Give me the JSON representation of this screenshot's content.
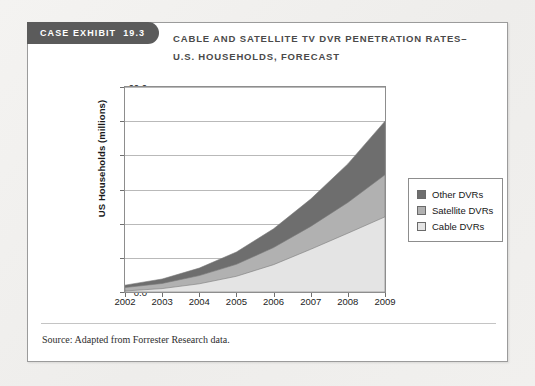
{
  "exhibit": {
    "label": "CASE EXHIBIT",
    "number": "19.3"
  },
  "title": {
    "line1": "CABLE AND SATELLITE TV DVR PENETRATION RATES–",
    "line2": "U.S. HOUSEHOLDS, FORECAST"
  },
  "source": "Source: Adapted from Forrester Research data.",
  "colors": {
    "other_dvrs": "#6e6e6e",
    "satellite_dvrs": "#b1b1b1",
    "cable_dvrs": "#e4e4e4",
    "tab_background": "#5b5b5b",
    "card_background": "#ffffff",
    "page_background": "#f1f0ee",
    "gridline": "#b9b9b9",
    "axis": "#8d8d8d"
  },
  "chart_data": {
    "type": "area",
    "stacked": true,
    "xlabel": "",
    "ylabel": "US Households (millions)",
    "categories": [
      "2002",
      "2003",
      "2004",
      "2005",
      "2006",
      "2007",
      "2008",
      "2009"
    ],
    "x": [
      2002,
      2003,
      2004,
      2005,
      2006,
      2007,
      2008,
      2009
    ],
    "ylim": [
      0.0,
      60.0
    ],
    "yticks": [
      "0.0",
      "10.0",
      "20.0",
      "30.0",
      "40.0",
      "50.0",
      "60.0"
    ],
    "ytick_values": [
      0.0,
      10.0,
      20.0,
      30.0,
      40.0,
      50.0,
      60.0
    ],
    "grid": true,
    "legend_position": "right",
    "series": [
      {
        "name": "Cable DVRs",
        "color": "#e4e4e4",
        "values": [
          0.3,
          1.0,
          2.4,
          4.6,
          8.0,
          12.5,
          17.2,
          22.0
        ]
      },
      {
        "name": "Satellite DVRs",
        "color": "#b1b1b1",
        "values": [
          1.0,
          1.5,
          2.4,
          3.5,
          5.0,
          6.7,
          9.0,
          12.3
        ]
      },
      {
        "name": "Other DVRs",
        "color": "#6e6e6e",
        "values": [
          0.7,
          1.3,
          2.2,
          3.6,
          5.5,
          8.0,
          11.3,
          15.7
        ]
      }
    ],
    "stack_tops": {
      "cable": [
        0.3,
        1.0,
        2.4,
        4.6,
        8.0,
        12.5,
        17.2,
        22.0
      ],
      "cable_satellite": [
        1.3,
        2.5,
        4.8,
        8.1,
        13.0,
        19.2,
        26.2,
        34.3
      ],
      "total": [
        2.0,
        3.8,
        7.0,
        11.7,
        18.5,
        27.2,
        37.5,
        50.0
      ]
    }
  },
  "legend": {
    "items": [
      {
        "label": "Other DVRs",
        "color": "#6e6e6e"
      },
      {
        "label": "Satellite DVRs",
        "color": "#b1b1b1"
      },
      {
        "label": "Cable DVRs",
        "color": "#e4e4e4"
      }
    ]
  }
}
